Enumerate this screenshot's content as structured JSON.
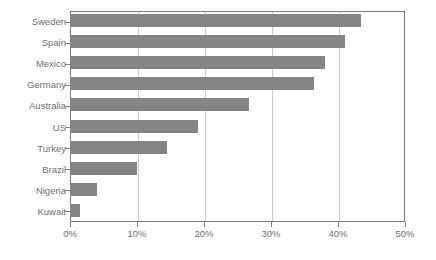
{
  "chart_data": {
    "type": "bar",
    "orientation": "horizontal",
    "title": "",
    "subtitle": "",
    "xlabel": "",
    "ylabel": "",
    "xlim": [
      0,
      50
    ],
    "ylim": null,
    "grid": "vertical",
    "legend": null,
    "bar_color": "#858585",
    "axis_color": "#7a7a7a",
    "gridline_color": "#c9c9c9",
    "text_color": "#6e6e6e",
    "background": "#ffffff",
    "xtick_labels": [
      "0%",
      "10%",
      "20%",
      "30%",
      "40%",
      "50%"
    ],
    "xtick_values": [
      0,
      10,
      20,
      30,
      40,
      50
    ],
    "categories": [
      "Sweden",
      "Spain",
      "Mexico",
      "Germany",
      "Australia",
      "US",
      "Turkey",
      "Brazil",
      "Nigeria",
      "Kuwait"
    ],
    "values": [
      43.4,
      41.0,
      38.0,
      36.4,
      26.7,
      19.1,
      14.5,
      10.0,
      4.1,
      1.5
    ],
    "value_unit": "%"
  }
}
